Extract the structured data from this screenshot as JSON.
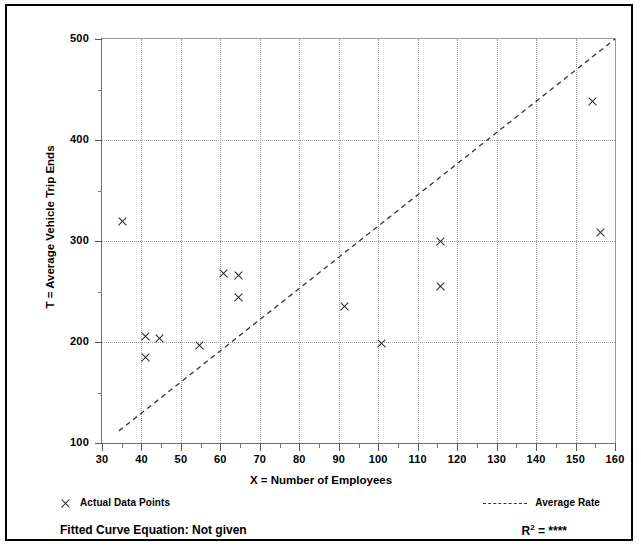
{
  "chart_data": {
    "type": "scatter",
    "title": "",
    "xlabel": "X = Number of Employees",
    "ylabel": "T = Average Vehicle Trip Ends",
    "xlim": [
      30,
      160
    ],
    "ylim": [
      100,
      500
    ],
    "xticks": [
      30,
      40,
      50,
      60,
      70,
      80,
      90,
      100,
      110,
      120,
      130,
      140,
      150,
      160
    ],
    "yticks": [
      100,
      200,
      300,
      400,
      500
    ],
    "xtick_minor_step": 5,
    "ytick_minor_step": 50,
    "grid": "dotted-both",
    "legend_position": "below-plot",
    "series": [
      {
        "name": "Actual Data Points",
        "type": "scatter",
        "marker": "x",
        "points": [
          {
            "x": 35.3,
            "y": 319
          },
          {
            "x": 40.9,
            "y": 205
          },
          {
            "x": 40.9,
            "y": 185
          },
          {
            "x": 44.6,
            "y": 203
          },
          {
            "x": 54.6,
            "y": 197
          },
          {
            "x": 60.9,
            "y": 268
          },
          {
            "x": 64.7,
            "y": 266
          },
          {
            "x": 64.7,
            "y": 244
          },
          {
            "x": 91.5,
            "y": 235
          },
          {
            "x": 100.9,
            "y": 199
          },
          {
            "x": 115.9,
            "y": 300
          },
          {
            "x": 115.9,
            "y": 255
          },
          {
            "x": 154.4,
            "y": 438
          },
          {
            "x": 156.4,
            "y": 308
          }
        ]
      },
      {
        "name": "Average Rate",
        "type": "line",
        "style": "dashed",
        "endpoints": [
          {
            "x": 34.3,
            "y": 112
          },
          {
            "x": 160,
            "y": 500
          }
        ]
      }
    ],
    "annotations": {
      "fitted_curve_label": "Fitted Curve Equation:",
      "fitted_curve_value": "Not given",
      "r_squared_label": "R",
      "r_squared_exponent": "2",
      "r_squared_value": "= ****"
    }
  },
  "axes": {
    "xlabel": "X = Number of Employees",
    "ylabel": "T = Average Vehicle Trip Ends",
    "xticks": [
      "30",
      "40",
      "50",
      "60",
      "70",
      "80",
      "90",
      "100",
      "110",
      "120",
      "130",
      "140",
      "150",
      "160"
    ],
    "yticks": [
      "500",
      "400",
      "300",
      "200",
      "100"
    ]
  },
  "legend": {
    "points_label": "Actual Data Points",
    "rate_label": "Average Rate"
  },
  "footer": {
    "fitted_curve": "Fitted Curve Equation:  Not given",
    "r_squared_base": "R",
    "r_squared_sup": "2",
    "r_squared_rest": " = ****"
  },
  "colors": {
    "marker": "#2b2b2b",
    "grid": "#9b9b9b",
    "axis": "#6e6e6e",
    "border": "#000000",
    "background": "#ffffff"
  }
}
